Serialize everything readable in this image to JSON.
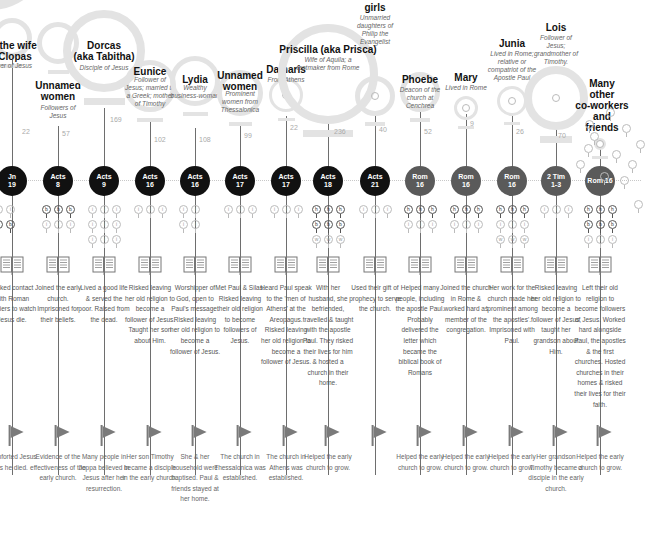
{
  "colors": {
    "ring": "#e3e3e3",
    "ref_black": "#111111",
    "ref_gray": "#5a5a5a",
    "timeline_dots": "#c8c8c8",
    "flag": "#7a7a7a",
    "text_dark": "#111111",
    "text_muted": "#666666"
  },
  "women": [
    {
      "name": "Mary the wife of Clopas",
      "name_visible": "ry the wife\nf Clopas",
      "desc": "ower of Jesus",
      "count": "22",
      "ref": "Jn\n19",
      "ref_color": "black",
      "mini_rows": [
        [
          "i",
          "i",
          "i"
        ],
        [
          "b",
          "b",
          "b"
        ]
      ],
      "risk": "Risked contact with Roman soldiers to watch Jesus die.",
      "impact": "Comforted Jesus as he died."
    },
    {
      "name": "Unnamed women",
      "desc": "Followers of Jesus",
      "count": "57",
      "ref": "Acts\n8",
      "ref_color": "black",
      "mini_rows": [
        [
          "b",
          "b",
          "b"
        ],
        [
          "i",
          "i",
          "i"
        ]
      ],
      "risk": "Joined the early church. Imprisoned for their beliefs.",
      "impact": "Evidence of the effectiveness of the early church."
    },
    {
      "name": "Dorcas (aka Tabitha)",
      "desc": "Disciple of Jesus",
      "count": "169",
      "ref": "Acts\n9",
      "ref_color": "black",
      "mini_rows": [
        [
          "i",
          "i",
          "i"
        ],
        [
          "i",
          "i",
          "i"
        ],
        [
          "i",
          "i",
          "i"
        ]
      ],
      "risk": "Lived a good life & served the poor. Raised from the dead.",
      "impact": "Many people in Joppa believed in Jesus after her resurrection."
    },
    {
      "name": "Eunice",
      "desc": "Follower of Jesus; married to a Greek; mother of Timothy",
      "count": "102",
      "ref": "Acts\n16",
      "ref_color": "black",
      "mini_rows": [
        [
          "i",
          "i",
          "i"
        ]
      ],
      "risk": "Risked leaving her old religion to become a follower of Jesus. Taught her son about Him.",
      "impact": "Her son Timothy became a disciple in the early church."
    },
    {
      "name": "Lydia",
      "desc": "Wealthy business-woman",
      "count": "108",
      "ref": "Acts\n16",
      "ref_color": "black",
      "mini_rows": [
        [
          "i",
          "i"
        ],
        [
          "i",
          "i"
        ]
      ],
      "risk": "Worshipper of God, open to Paul's message. Risked leaving her old religion to become a follower of Jesus.",
      "impact": "She & her household were baptised. Paul & friends stayed at her home."
    },
    {
      "name": "Unnamed women",
      "desc": "Prominent women from Thessalonica",
      "count": "99",
      "ref": "Acts\n17",
      "ref_color": "black",
      "mini_rows": [
        [
          "i",
          "i",
          "i"
        ]
      ],
      "risk": "Met Paul & Silas. Risked leaving their old religion to become followers of Jesus.",
      "impact": "The church in Thessalonica was established."
    },
    {
      "name": "Damaris",
      "desc": "From Athens",
      "count": "22",
      "ref": "Acts\n17",
      "ref_color": "black",
      "mini_rows": [
        [
          "i",
          "i",
          "i"
        ]
      ],
      "risk": "Heard Paul speak to the 'men of Athens' at the Areopagus. Risked leaving her old religion to become a follower of Jesus.",
      "impact": "The church in Athens was established."
    },
    {
      "name": "Priscilla (aka Prisca)",
      "desc": "Wife of Aquila; a tentmaker from Rome",
      "count": "236",
      "ref": "Acts\n18",
      "ref_color": "black",
      "mini_rows": [
        [
          "h",
          "h",
          "h"
        ],
        [
          "b",
          "b",
          "b"
        ],
        [
          "w",
          "w",
          "w"
        ]
      ],
      "risk": "With her husband, she befriended, travelled & taught with the apostle Paul. They risked their lives for him & hosted a church in their home.",
      "impact": "Helped the early church to grow."
    },
    {
      "name": "girls",
      "desc": "Unmarried daughters of Philip the Evangelist",
      "count": "40",
      "ref": "Acts\n21",
      "ref_color": "black",
      "mini_rows": [
        [
          "i",
          "i",
          "i"
        ]
      ],
      "risk": "Used their gift of prophecy to serve the church.",
      "impact": ""
    },
    {
      "name": "Phoebe",
      "desc": "Deacon of the church at Cenchrea",
      "count": "52",
      "ref": "Rom\n16",
      "ref_color": "gray",
      "mini_rows": [
        [
          "h",
          "h",
          "h"
        ],
        [
          "i",
          "i",
          "i"
        ]
      ],
      "risk": "Helped many people, including the apostle Paul. Probably delivered the letter which became the biblical book of Romans",
      "impact": "Helped the early church to grow."
    },
    {
      "name": "Mary",
      "desc": "Lived in Rome",
      "count": "9",
      "ref": "Rom\n16",
      "ref_color": "gray",
      "mini_rows": [
        [
          "h",
          "h",
          "h"
        ],
        [
          "i",
          "i",
          "i"
        ]
      ],
      "risk": "Joined the church in Rome & worked hard as member of the congregation.",
      "impact": "Helped the early church to grow."
    },
    {
      "name": "Junia",
      "desc": "Lived in Rome; relative or compatriot of the Apostle Paul",
      "count": "26",
      "ref": "Rom\n16",
      "ref_color": "gray",
      "mini_rows": [
        [
          "h",
          "h",
          "h"
        ],
        [
          "i",
          "i",
          "i"
        ],
        [
          "w",
          "w",
          "w"
        ]
      ],
      "risk": "Her work for the church made her 'prominent among the apostles'. Imprisoned with Paul.",
      "impact": "Helped the early church to grow."
    },
    {
      "name": "Lois",
      "desc": "Follower of Jesus; grandmother of Timothy.",
      "count": "70",
      "ref": "2 Tim\n1-3",
      "ref_color": "gray",
      "mini_rows": [
        [
          "i",
          "i",
          "i"
        ]
      ],
      "risk": "Risked leaving her old religion to become a follower of Jesus, taught her grandson about Him.",
      "impact": "Her grandson Timothy became a disciple in the early church."
    },
    {
      "name": "Many other co-workers and friends",
      "desc": "",
      "count": "",
      "ref": "Rom 16",
      "ref_color": "gray",
      "mini_rows": [
        [
          "h",
          "h",
          "h"
        ],
        [
          "b",
          "b",
          "b"
        ],
        [
          "i",
          "i",
          "i"
        ]
      ],
      "risk": "Left their old religion to become followers of Jesus. Worked hard alongside Paul, the apostles & the first churches. Hosted churches in their homes & risked their lives for their faith.",
      "impact": "Helped the early church to grow."
    }
  ]
}
